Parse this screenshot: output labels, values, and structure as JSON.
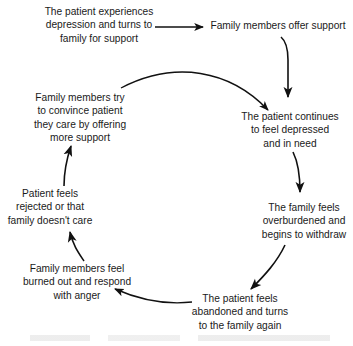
{
  "diagram": {
    "type": "cycle",
    "nodes": [
      {
        "id": "start",
        "lines": [
          "The patient experiences",
          "depression and turns to",
          "family for support"
        ]
      },
      {
        "id": "offer",
        "lines": [
          "Family members offer support"
        ]
      },
      {
        "id": "continues",
        "lines": [
          "The patient continues",
          "to feel depressed",
          "and in need"
        ]
      },
      {
        "id": "withdraw",
        "lines": [
          "The family feels",
          "overburdened and",
          "begins to withdraw"
        ]
      },
      {
        "id": "abandoned",
        "lines": [
          "The patient feels",
          "abandoned and turns",
          "to the family again"
        ]
      },
      {
        "id": "anger",
        "lines": [
          "Family members feel",
          "burned out and respond",
          "with anger"
        ]
      },
      {
        "id": "rejected",
        "lines": [
          "Patient feels",
          "rejected or that",
          "family doesn't care"
        ]
      },
      {
        "id": "convince",
        "lines": [
          "Family members try",
          "to convince patient",
          "they care by offering",
          "more support"
        ]
      }
    ],
    "edges": [
      {
        "from": "start",
        "to": "offer"
      },
      {
        "from": "offer",
        "to": "continues"
      },
      {
        "from": "continues",
        "to": "withdraw"
      },
      {
        "from": "withdraw",
        "to": "abandoned"
      },
      {
        "from": "abandoned",
        "to": "anger"
      },
      {
        "from": "anger",
        "to": "rejected"
      },
      {
        "from": "rejected",
        "to": "convince"
      },
      {
        "from": "convince",
        "to": "continues"
      }
    ]
  },
  "colors": {
    "text": "#1a1a1a",
    "arrow": "#111111",
    "background": "#ffffff"
  }
}
